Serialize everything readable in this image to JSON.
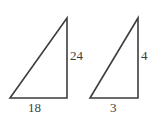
{
  "figure": {
    "type": "geometry-diagram",
    "background_color": "#ffffff",
    "stroke_color": "#3d3d3d",
    "text_color": "#3d3d3d",
    "stroke_width": 1.6,
    "shapes": [
      {
        "id": "left-triangle",
        "name": "left-right-triangle",
        "vertices": [
          {
            "name": "bottom-left",
            "x": 10,
            "y": 98
          },
          {
            "name": "bottom-right",
            "x": 67,
            "y": 98
          },
          {
            "name": "top-right",
            "x": 67,
            "y": 18
          }
        ],
        "right_angle_at": "bottom-right",
        "labels": {
          "vertical_leg": "24",
          "horizontal_leg": "18"
        }
      },
      {
        "id": "right-triangle",
        "name": "right-right-triangle",
        "vertices": [
          {
            "name": "bottom-left",
            "x": 90,
            "y": 98
          },
          {
            "name": "bottom-right",
            "x": 138,
            "y": 98
          },
          {
            "name": "top-right",
            "x": 138,
            "y": 18
          }
        ],
        "right_angle_at": "bottom-right",
        "labels": {
          "vertical_leg": "4",
          "horizontal_leg": "3"
        }
      }
    ],
    "labels": {
      "left_vertical": "24",
      "left_base": "18",
      "right_vertical": "4",
      "right_base": "3"
    }
  }
}
